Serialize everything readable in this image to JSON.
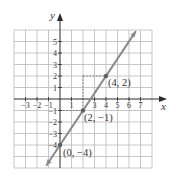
{
  "chart_data": {
    "type": "line",
    "title": "",
    "xlabel": "x",
    "ylabel": "y",
    "xlim": [
      -4,
      8
    ],
    "ylim": [
      -6,
      6
    ],
    "grid": true,
    "x_tick_labels": [
      "−3",
      "−2",
      "−1",
      "1",
      "3",
      "4",
      "5",
      "6",
      "7"
    ],
    "x_ticks": [
      -3,
      -2,
      -1,
      1,
      3,
      4,
      5,
      6,
      7
    ],
    "y_tick_labels": [
      "5",
      "4",
      "3",
      "2",
      "1",
      "−1",
      "−2",
      "−3",
      "−4"
    ],
    "y_ticks": [
      5,
      4,
      3,
      2,
      1,
      -1,
      -2,
      -3,
      -4
    ],
    "series": [
      {
        "name": "y = (3/2)x − 4",
        "x": [
          -1.2,
          6.6
        ],
        "y": [
          -5.8,
          5.9
        ],
        "color": "#8a8a8a",
        "arrows": "both"
      }
    ],
    "points": [
      {
        "x": 4,
        "y": 2,
        "label": "(4, 2)"
      },
      {
        "x": 2,
        "y": -1,
        "label": "(2, −1)"
      },
      {
        "x": 0,
        "y": -4,
        "label": "(0, −4)"
      }
    ],
    "guides": [
      {
        "from": [
          2,
          2
        ],
        "to": [
          4,
          2
        ]
      },
      {
        "from": [
          2,
          2
        ],
        "to": [
          2,
          -1
        ]
      },
      {
        "from": [
          0,
          -1
        ],
        "to": [
          2,
          -1
        ]
      }
    ]
  },
  "labels": {
    "x_axis": "x",
    "y_axis": "y",
    "point_a": "(4, 2)",
    "point_b": "(2, −1)",
    "point_c": "(0, −4)"
  },
  "colors": {
    "grid": "#b9b9b9",
    "axis": "#2a2a2a",
    "line": "#8a8a8a",
    "point": "#5e5e5e"
  }
}
